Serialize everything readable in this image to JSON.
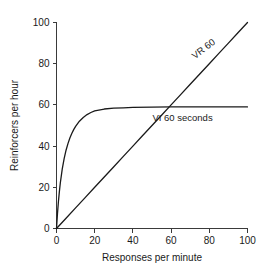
{
  "chart_data": {
    "type": "line",
    "title": "",
    "xlabel": "Responses per minute",
    "ylabel": "Reinforcers per hour",
    "xlim": [
      0,
      100
    ],
    "ylim": [
      0,
      100
    ],
    "xticks": [
      0,
      20,
      40,
      60,
      80,
      100
    ],
    "yticks": [
      0,
      20,
      40,
      60,
      80,
      100
    ],
    "xtick_labels": [
      "0",
      "20",
      "40",
      "60",
      "80",
      "100"
    ],
    "ytick_labels": [
      "0",
      "20",
      "40",
      "60",
      "80",
      "100"
    ],
    "grid": false,
    "legend_position": "inline-annotation",
    "line_color": "#1a1a1a",
    "axis_color": "#3a3a3a",
    "background_color": "#ffffff",
    "series": [
      {
        "name": "VR 60",
        "annotation": "VR 60",
        "annotation_rotation": -38,
        "annotation_x": 78,
        "annotation_y": 86,
        "description": "linear ratio feedback function, y = x",
        "x": [
          0,
          5,
          10,
          15,
          20,
          25,
          30,
          35,
          40,
          45,
          50,
          55,
          60,
          65,
          70,
          75,
          80,
          85,
          90,
          95,
          100
        ],
        "values": [
          0,
          5,
          10,
          15,
          20,
          25,
          30,
          35,
          40,
          45,
          50,
          55,
          60,
          65,
          70,
          75,
          80,
          85,
          90,
          95,
          100
        ]
      },
      {
        "name": "VI 60 seconds",
        "annotation": "VI 60 seconds",
        "annotation_rotation": 0,
        "annotation_x": 66,
        "annotation_y": 52,
        "description": "hyperbolic interval feedback function asymptoting near 59 reinforcers per hour",
        "x": [
          0,
          0.5,
          1,
          1.5,
          2,
          3,
          4,
          5,
          6,
          7,
          8,
          9,
          10,
          12,
          14,
          16,
          18,
          20,
          25,
          30,
          35,
          40,
          50,
          60,
          70,
          80,
          90,
          100
        ],
        "values": [
          0,
          7.1,
          13.0,
          17.9,
          22.1,
          28.8,
          33.9,
          38.0,
          41.2,
          43.9,
          46.1,
          48.0,
          49.6,
          52.1,
          53.9,
          55.3,
          56.3,
          57.1,
          58.0,
          58.4,
          58.6,
          58.8,
          58.9,
          59.0,
          59.0,
          59.0,
          59.0,
          59.0
        ]
      }
    ]
  },
  "figure": {
    "alt": "Graph comparing VR 60 and VI 60 seconds feedback functions"
  }
}
